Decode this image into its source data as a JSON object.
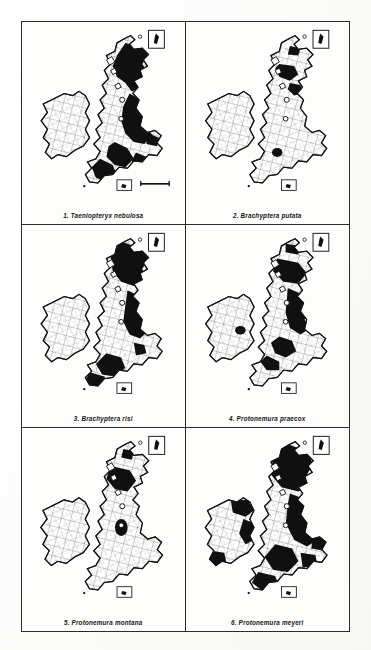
{
  "figure": {
    "kind": "distribution-map-plate",
    "region": "British Isles (Great Britain and Ireland), vice-county grid",
    "columns": 2,
    "rows": 3,
    "shading_legend": "solid black = species recorded in vice-county; white = no record",
    "ink_color": "#101010",
    "paper_color": "#fdfdfc",
    "frame_color": "#2b2b2b"
  },
  "panels": [
    {
      "number": "1.",
      "species": "Taeniopteryx nebulosa",
      "caption": "1.  Taeniopteryx nebulosa",
      "coverage": "widespread-britain",
      "has_inset_box": true,
      "has_scale_bar": true
    },
    {
      "number": "2.",
      "species": "Brachyptera putata",
      "caption": "2.  Brachyptera putata",
      "coverage": "scotland-only-sparse",
      "has_inset_box": true,
      "has_scale_bar": false
    },
    {
      "number": "3.",
      "species": "Brachyptera risi",
      "caption": "3.  Brachyptera risi",
      "coverage": "scotland-wales-north",
      "has_inset_box": true,
      "has_scale_bar": false
    },
    {
      "number": "4.",
      "species": "Protonemura praecox",
      "caption": "4.  Protonemura praecox",
      "coverage": "scotland-north-england",
      "has_inset_box": true,
      "has_scale_bar": false
    },
    {
      "number": "5.",
      "species": "Protonemura montana",
      "caption": "5.  Protonemura montana",
      "coverage": "highlands-sparse",
      "has_inset_box": true,
      "has_scale_bar": false
    },
    {
      "number": "6.",
      "species": "Protonemura meyeri",
      "caption": "6.  Protonemura meyeri",
      "coverage": "widespread-britain-ireland",
      "has_inset_box": true,
      "has_scale_bar": false
    }
  ]
}
